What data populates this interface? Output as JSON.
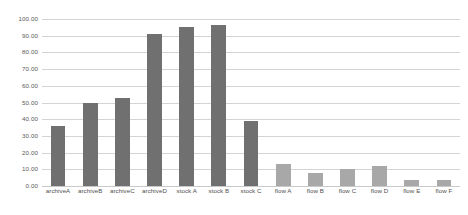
{
  "chart_data": {
    "type": "bar",
    "title": "",
    "xlabel": "",
    "ylabel": "",
    "ylim": [
      0,
      100
    ],
    "grid": true,
    "legend": "none",
    "y_ticks": [
      "100.00",
      "90.00",
      "80.00",
      "70.00",
      "60.00",
      "50.00",
      "40.00",
      "30.00",
      "20.00",
      "10.00",
      "0.00"
    ],
    "y_tick_values": [
      100,
      90,
      80,
      70,
      60,
      50,
      40,
      30,
      20,
      10,
      0
    ],
    "categories": [
      "archiveA",
      "archiveB",
      "archiveC",
      "archiveD",
      "stock A",
      "stock B",
      "stock C",
      "flow A",
      "flow B",
      "flow C",
      "flow D",
      "flow E",
      "flow F"
    ],
    "values": [
      36,
      50,
      53,
      91,
      95,
      96.5,
      39,
      13,
      8,
      10,
      12,
      3.5,
      3.5
    ],
    "bar_colors": [
      "#707070",
      "#707070",
      "#707070",
      "#707070",
      "#707070",
      "#707070",
      "#707070",
      "#a8a8a8",
      "#a8a8a8",
      "#a8a8a8",
      "#a8a8a8",
      "#a8a8a8",
      "#a8a8a8"
    ],
    "colors": {
      "dark_bar": "#707070",
      "light_bar": "#a8a8a8",
      "gridline": "#d4d4d4",
      "tick_label": "#5a5a5a",
      "background": "#ffffff"
    }
  }
}
